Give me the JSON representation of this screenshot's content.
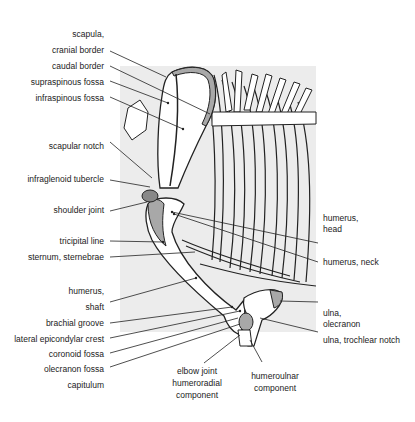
{
  "diagram": {
    "background_color": "#ececec",
    "bone_color": "#ffffff",
    "cartilage_color": "#a8a8a8",
    "line_color": "#222222",
    "labels_left": [
      {
        "id": "scapula",
        "text": "scapula,"
      },
      {
        "id": "cranial-border",
        "text": "cranial border"
      },
      {
        "id": "caudal-border",
        "text": "caudal border"
      },
      {
        "id": "supraspinous-fossa",
        "text": "supraspinous fossa"
      },
      {
        "id": "infraspinous-fossa",
        "text": "infraspinous fossa"
      },
      {
        "id": "scapular-notch",
        "text": "scapular  notch"
      },
      {
        "id": "infraglenoid-tubercle",
        "text": "infraglenoid tubercle"
      },
      {
        "id": "shoulder-joint",
        "text": "shoulder joint"
      },
      {
        "id": "tricipital-line",
        "text": "tricipital line"
      },
      {
        "id": "sternum",
        "text": "sternum, sternebrae"
      },
      {
        "id": "humerus",
        "text": "humerus,"
      },
      {
        "id": "shaft",
        "text": "shaft"
      },
      {
        "id": "brachial-groove",
        "text": "brachial groove"
      },
      {
        "id": "lateral-epicondylar-crest",
        "text": "lateral  epicondylar  crest"
      },
      {
        "id": "coronoid-fossa",
        "text": "coronoid fossa"
      },
      {
        "id": "olecranon-fossa",
        "text": "olecranon fossa"
      },
      {
        "id": "capitulum",
        "text": "capitulum"
      }
    ],
    "labels_right": [
      {
        "id": "humerus-head-1",
        "text": "humerus,"
      },
      {
        "id": "humerus-head-2",
        "text": "head"
      },
      {
        "id": "humerus-neck",
        "text": "humerus,  neck"
      },
      {
        "id": "ulna-olecranon-1",
        "text": "ulna,"
      },
      {
        "id": "ulna-olecranon-2",
        "text": "olecranon"
      },
      {
        "id": "ulna-trochlear-notch",
        "text": "ulna, trochlear notch"
      }
    ],
    "labels_bottom": [
      {
        "id": "elbow-joint-1",
        "text": "elbow joint"
      },
      {
        "id": "elbow-joint-2",
        "text": "humeroradial"
      },
      {
        "id": "elbow-joint-3",
        "text": "component"
      },
      {
        "id": "humeroulnar-1",
        "text": "humeroulnar"
      },
      {
        "id": "humeroulnar-2",
        "text": "component"
      }
    ]
  }
}
